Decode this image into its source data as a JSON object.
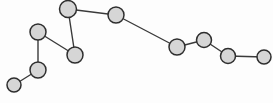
{
  "canvas": {
    "width": 273,
    "height": 103,
    "background_color": "#fdfdfd"
  },
  "style": {
    "node_fill_color": "#d6d6d6",
    "node_stroke_color": "#2e2e2e",
    "node_stroke_width": 1.5,
    "edge_color": "#3a3a3a",
    "edge_width": 1.4
  },
  "chart_data": {
    "type": "scatter",
    "title": "",
    "subtitle": "",
    "xlabel": "",
    "ylabel": "",
    "grid": false,
    "legend": "none",
    "xlim": [
      0,
      273
    ],
    "ylim": [
      0,
      103
    ],
    "nodes": [
      {
        "id": 0,
        "label": "",
        "x": 14,
        "y": 85,
        "r": 7.0
      },
      {
        "id": 1,
        "label": "",
        "x": 38,
        "y": 70,
        "r": 8.0
      },
      {
        "id": 2,
        "label": "",
        "x": 38,
        "y": 32,
        "r": 8.0
      },
      {
        "id": 3,
        "label": "",
        "x": 75,
        "y": 55,
        "r": 8.0
      },
      {
        "id": 4,
        "label": "",
        "x": 68,
        "y": 9,
        "r": 8.5
      },
      {
        "id": 5,
        "label": "",
        "x": 116,
        "y": 15,
        "r": 8.0
      },
      {
        "id": 6,
        "label": "",
        "x": 177,
        "y": 47,
        "r": 8.0
      },
      {
        "id": 7,
        "label": "",
        "x": 204,
        "y": 40,
        "r": 7.5
      },
      {
        "id": 8,
        "label": "",
        "x": 228,
        "y": 56,
        "r": 7.5
      },
      {
        "id": 9,
        "label": "",
        "x": 264,
        "y": 57,
        "r": 7.0
      }
    ],
    "edges": [
      {
        "source": 0,
        "target": 1
      },
      {
        "source": 1,
        "target": 2
      },
      {
        "source": 2,
        "target": 3
      },
      {
        "source": 3,
        "target": 4
      },
      {
        "source": 4,
        "target": 5
      },
      {
        "source": 5,
        "target": 6
      },
      {
        "source": 6,
        "target": 7
      },
      {
        "source": 7,
        "target": 8
      },
      {
        "source": 8,
        "target": 9
      }
    ]
  }
}
